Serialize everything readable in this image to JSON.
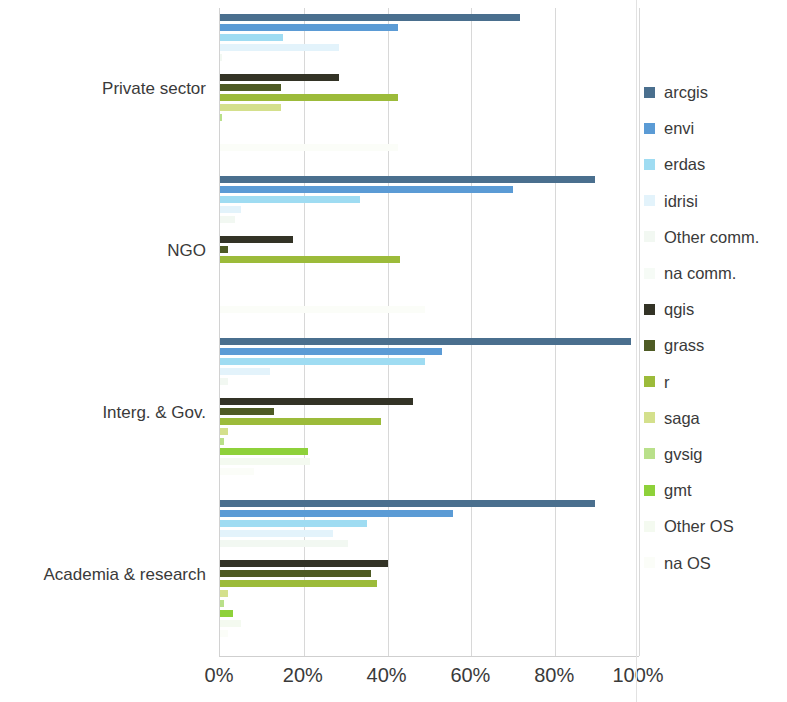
{
  "chart_data": {
    "type": "bar",
    "orientation": "horizontal",
    "title": "",
    "subtitle": "",
    "xlabel": "",
    "ylabel": "",
    "xlim": [
      0,
      100
    ],
    "xtick_labels": [
      "0%",
      "20%",
      "40%",
      "60%",
      "80%",
      "100%"
    ],
    "xtick_values": [
      0,
      20,
      40,
      60,
      80,
      100
    ],
    "grid": true,
    "grid_axis": "x",
    "legend_position": "right",
    "categories": [
      "Private sector",
      "NGO",
      "Interg. & Gov.",
      "Academia & research"
    ],
    "series": [
      {
        "name": "arcgis",
        "color": "#4a6f8e",
        "values": [
          71.5,
          89.5,
          98.0,
          89.5
        ]
      },
      {
        "name": "envi",
        "color": "#5b9bd5",
        "values": [
          42.5,
          70.0,
          53.0,
          55.5
        ]
      },
      {
        "name": "erdas",
        "color": "#9fdcf2",
        "values": [
          15.0,
          33.5,
          49.0,
          35.0
        ]
      },
      {
        "name": "idrisi",
        "color": "#e3f3fb",
        "values": [
          28.5,
          5.0,
          12.0,
          27.0
        ]
      },
      {
        "name": "Other comm.",
        "color": "#f2f8f2",
        "values": [
          0.5,
          3.5,
          2.0,
          30.5
        ]
      },
      {
        "name": "na comm.",
        "color": "#f6fbf6",
        "values": [
          0.0,
          0.0,
          0.0,
          0.0
        ]
      },
      {
        "name": "qgis",
        "color": "#333326",
        "values": [
          28.5,
          17.5,
          46.0,
          40.0
        ]
      },
      {
        "name": "grass",
        "color": "#4e5b24",
        "values": [
          14.5,
          2.0,
          13.0,
          36.0
        ]
      },
      {
        "name": "r",
        "color": "#9cbb3a",
        "values": [
          42.5,
          43.0,
          38.5,
          37.5
        ]
      },
      {
        "name": "saga",
        "color": "#d4e08c",
        "values": [
          14.5,
          0.0,
          2.0,
          2.0
        ]
      },
      {
        "name": "gvsig",
        "color": "#b9e08a",
        "values": [
          0.5,
          0.0,
          1.0,
          1.0
        ]
      },
      {
        "name": "gmt",
        "color": "#8ed13a",
        "values": [
          0.0,
          0.0,
          21.0,
          3.0
        ]
      },
      {
        "name": "Other OS",
        "color": "#f4faf0",
        "values": [
          0.0,
          0.0,
          21.5,
          5.0
        ]
      },
      {
        "name": "na OS",
        "color": "#fbfdf8",
        "values": [
          42.5,
          49.0,
          8.0,
          2.0
        ]
      }
    ],
    "legend_entries": [
      "arcgis",
      "envi",
      "erdas",
      "idrisi",
      "Other comm.",
      "na comm.",
      "qgis",
      "grass",
      "r",
      "saga",
      "gvsig",
      "gmt",
      "Other OS",
      "na OS"
    ]
  }
}
